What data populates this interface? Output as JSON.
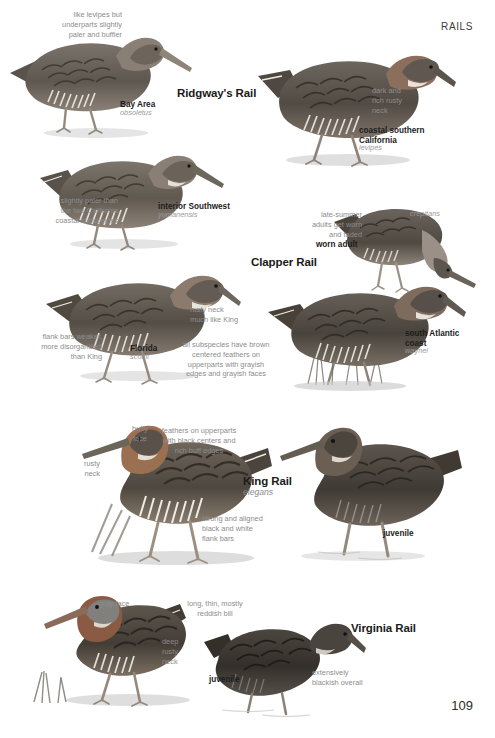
{
  "page": {
    "running_head": "RAILS",
    "folio": "109"
  },
  "species": [
    {
      "id": "ridgways-rail",
      "common_name": "Ridgway's Rail",
      "scientific_name": "",
      "forms": [
        {
          "label": "Bay Area",
          "sci": "obsoletus"
        },
        {
          "label": "coastal southern\nCalifornia",
          "sci": "levipes"
        },
        {
          "label": "interior Southwest",
          "sci": "yumanensis"
        }
      ],
      "callouts": [
        "like levipes but\nunderparts slightly\npaler and buffier",
        "dark and\nrich rusty\nneck",
        "slightly paler than\nthe two California\ncoastal subspecies"
      ]
    },
    {
      "id": "clapper-rail",
      "common_name": "Clapper Rail",
      "scientific_name": "",
      "forms": [
        {
          "label": "",
          "sci": "crepitans"
        },
        {
          "label": "Florida",
          "sci": "scottii"
        },
        {
          "label": "south Atlantic\ncoast",
          "sci": "waynei"
        }
      ],
      "age_labels": [
        "worn adult"
      ],
      "callouts": [
        "late-summer\nadults get worn\nand faded",
        "rusty neck\nmuch like King",
        "flank bars weaker,\nmore disorganized\nthan King",
        "all subspecies have brown\ncentered feathers on\nupperparts with grayish\nedges and grayish faces"
      ]
    },
    {
      "id": "king-rail",
      "common_name": "King Rail",
      "scientific_name": "elegans",
      "age_labels": [
        "juvenile"
      ],
      "callouts": [
        "buffy\nface",
        "feathers on upperparts\nwith black centers and\nrich buff edges",
        "rusty\nneck",
        "strong and aligned\nblack and white\nflank bars"
      ]
    },
    {
      "id": "virginia-rail",
      "common_name": "Virginia Rail",
      "scientific_name": "",
      "age_labels": [
        "juvenile"
      ],
      "callouts": [
        "gray face",
        "long, thin, mostly\nreddish bill",
        "deep\nrusty\nneck",
        "extensively\nblackish overall"
      ]
    }
  ],
  "labels": {
    "ridgways_rail": "Ridgway's Rail",
    "clapper_rail": "Clapper Rail",
    "king_rail": "King Rail",
    "king_rail_sci": "elegans",
    "virginia_rail": "Virginia Rail",
    "bay_area": "Bay Area",
    "bay_area_sci": "obsoletus",
    "coastal_socal_line1": "coastal southern",
    "coastal_socal_line2": "California",
    "coastal_socal_sci": "levipes",
    "interior_southwest": "interior Southwest",
    "interior_southwest_sci": "yumanensis",
    "crepitans_sci": "crepitans",
    "worn_adult": "worn adult",
    "florida": "Florida",
    "florida_sci": "scottii",
    "south_atlantic_line1": "south Atlantic",
    "south_atlantic_line2": "coast",
    "south_atlantic_sci": "waynei",
    "king_juvenile": "juvenile",
    "virginia_juvenile": "juvenile"
  },
  "callouts": {
    "like_levipes": "like levipes but\nunderparts slightly\npaler and buffier",
    "dark_rich_rusty": "dark and\nrich rusty\nneck",
    "slightly_paler": "slightly paler than\nthe two California\ncoastal subspecies",
    "late_summer": "late-summer\nadults get worn\nand faded",
    "rusty_neck_king": "rusty neck\nmuch like King",
    "flank_bars_weaker": "flank bars weaker,\nmore disorganized\nthan King",
    "all_subspecies": "all subspecies have brown\ncentered feathers on\nupperparts with grayish\nedges and grayish faces",
    "buffy_face": "buffy\nface",
    "feathers_upperparts": "feathers on upperparts\nwith black centers and\nrich buff edges",
    "rusty_neck": "rusty\nneck",
    "strong_aligned": "strong and aligned\nblack and white\nflank bars",
    "gray_face": "gray face",
    "long_thin_bill": "long, thin, mostly\nreddish bill",
    "deep_rusty_neck": "deep\nrusty\nneck",
    "extensively_blackish": "extensively\nblackish overall"
  },
  "colors": {
    "page_bg": "#ffffff",
    "callout_text": "#8c8c8c",
    "label_text": "#1c1c1c",
    "sci_text": "#9a9a9a",
    "running_head": "#3c3c3c",
    "bird_body_dark": "#4a4641",
    "bird_body_mid": "#6e6760",
    "bird_body_light": "#9a918a",
    "bird_breast": "#8a7d72",
    "bird_bill": "#7d766d",
    "water": "#d8d8d8",
    "shadow": "#bfbfbf"
  }
}
